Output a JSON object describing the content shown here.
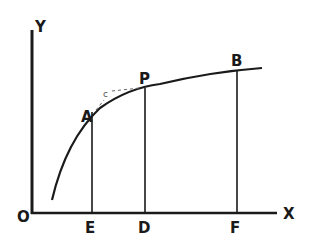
{
  "diagram": {
    "axes": {
      "y_label": "Y",
      "x_label": "X",
      "origin_label": "O"
    },
    "points": {
      "A": "A",
      "P": "P",
      "B": "B",
      "E": "E",
      "D": "D",
      "F": "F"
    },
    "annotation": "c",
    "colors": {
      "ink": "#1a1a1a",
      "background": "#ffffff",
      "dashed": "#666666"
    }
  }
}
